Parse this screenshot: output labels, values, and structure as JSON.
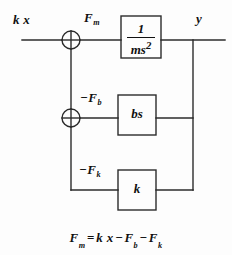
{
  "figure": {
    "ink_color": "#101010",
    "background_color": "#fdfdfd"
  },
  "signals": {
    "input_label": "k x",
    "input_icon": "input-signal-arrow",
    "sum_out_label": "F",
    "sum_out_sub": "m",
    "output_label": "y",
    "damper_feedback_label": "−F",
    "damper_feedback_sub": "b",
    "spring_feedback_label": "−F",
    "spring_feedback_sub": "k"
  },
  "blocks": [
    {
      "id": "plant",
      "name": "plant-transfer-function-block",
      "numerator": "1",
      "denominator": "ms",
      "denominator_exp": "2",
      "display": "1/(ms^2)"
    },
    {
      "id": "damper",
      "name": "damper-gain-block",
      "display": "bs"
    },
    {
      "id": "spring",
      "name": "spring-gain-block",
      "display": "k"
    }
  ],
  "summing_junctions": [
    {
      "id": "sum-1",
      "name": "summing-junction-force",
      "glyph": "⊕"
    },
    {
      "id": "sum-2",
      "name": "summing-junction-damper",
      "glyph": "⊕"
    }
  ],
  "equation": {
    "lhs": "F",
    "lhs_sub": "m",
    "eq": "=",
    "term1": "k x",
    "minus1": "−",
    "term2": "F",
    "term2_sub": "b",
    "minus2": "−",
    "term3": "F",
    "term3_sub": "k",
    "full_text": "F_m = k x − F_b − F_k"
  }
}
